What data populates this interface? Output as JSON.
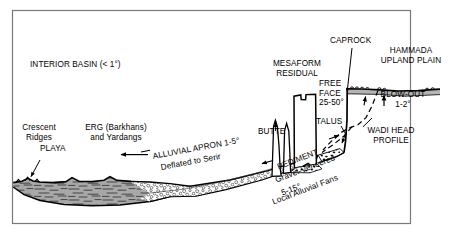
{
  "figure": {
    "kind": "desert-landform-cross-section",
    "frame_color": "#7a7a7a",
    "ink_color": "#000000",
    "playa_fill": "#a8a8a8",
    "apron_fill": "#ffffff",
    "hammada_shade": "#b4b4b4",
    "background": "#ffffff"
  },
  "labels": {
    "interior_basin": "INTERIOR BASIN (< 1°)",
    "crescent_ridges_line1": "Crescent",
    "crescent_ridges_line2": "Ridges",
    "playa": "PLAYA",
    "erg_line1": "ERG (Barkhans)",
    "erg_line2": "and Yardangs",
    "alluvial_apron": "ALLUVIAL APRON 1-5°",
    "deflated_to_serir": "Deflated to Serir",
    "butte": "BUTTE",
    "mesaform_line1": "MESAFORM",
    "mesaform_line2": "RESIDUAL",
    "free_face_line1": "FREE",
    "free_face_line2": "FACE",
    "free_face_line3": "25-50°",
    "talus": "TALUS",
    "caprock": "CAPROCK",
    "hammada_line1": "HAMMADA",
    "hammada_line2": "UPLAND PLAIN",
    "blow_out_line1": "BLOW-OUT",
    "blow_out_line2": "1-2°",
    "wadi_head_line1": "WADI HEAD",
    "wadi_head_line2": "PROFILE",
    "pediment": "PEDIMENT",
    "gravel_veneered": "Gravel-Veneered",
    "pediment_slope": "5-15°",
    "local_alluvial_fans": "Local Alluvial Fans"
  }
}
